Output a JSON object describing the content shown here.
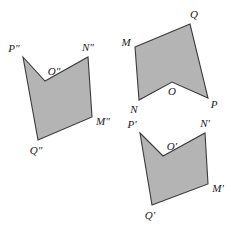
{
  "figure": {
    "background_color": "#ffffff",
    "fill_color": "#b4b4b4",
    "stroke_color": "#3b3b3b",
    "stroke_width": 1.1,
    "label_color": "#1a1a1a",
    "label_font_size": 11
  },
  "shapes": [
    {
      "id": "shape-double-prime",
      "name": "polygon-MNOPQ-double-prime",
      "notation": "double-prime",
      "points": "23,57 45,81 88,57 92,117 38,140",
      "vertices": [
        {
          "key": "P",
          "label": "P\"",
          "x": 23,
          "y": 57,
          "lx": 14,
          "ly": 49,
          "anchor": "middle"
        },
        {
          "key": "O",
          "label": "O\"",
          "x": 45,
          "y": 81,
          "lx": 54,
          "ly": 72,
          "anchor": "middle"
        },
        {
          "key": "N",
          "label": "N\"",
          "x": 88,
          "y": 57,
          "lx": 88,
          "ly": 48,
          "anchor": "middle"
        },
        {
          "key": "M",
          "label": "M\"",
          "x": 92,
          "y": 117,
          "lx": 103,
          "ly": 122,
          "anchor": "middle"
        },
        {
          "key": "Q",
          "label": "Q\"",
          "x": 38,
          "y": 140,
          "lx": 36,
          "ly": 151,
          "anchor": "middle"
        }
      ]
    },
    {
      "id": "shape-plain",
      "name": "polygon-MNOPQ",
      "notation": "plain",
      "points": "135,47 190,24 208,98 172,82 139,100",
      "vertices": [
        {
          "key": "M",
          "label": "M",
          "x": 135,
          "y": 47,
          "lx": 126,
          "ly": 43,
          "anchor": "middle"
        },
        {
          "key": "Q",
          "label": "Q",
          "x": 190,
          "y": 24,
          "lx": 194,
          "ly": 15,
          "anchor": "middle"
        },
        {
          "key": "P",
          "label": "P",
          "x": 208,
          "y": 98,
          "lx": 214,
          "ly": 105,
          "anchor": "middle"
        },
        {
          "key": "O",
          "label": "O",
          "x": 172,
          "y": 82,
          "lx": 172,
          "ly": 92,
          "anchor": "middle"
        },
        {
          "key": "N",
          "label": "N",
          "x": 139,
          "y": 100,
          "lx": 134,
          "ly": 110,
          "anchor": "middle"
        }
      ]
    },
    {
      "id": "shape-prime",
      "name": "polygon-MNOPQ-prime",
      "notation": "prime",
      "points": "140,133 163,156 205,133 208,184 152,205"
    }
  ],
  "shapes_extra": {
    "prime_vertices": [
      {
        "key": "P",
        "label": "P'",
        "x": 140,
        "y": 133,
        "lx": 132,
        "ly": 125,
        "anchor": "middle"
      },
      {
        "key": "O",
        "label": "O'",
        "x": 163,
        "y": 156,
        "lx": 172,
        "ly": 147,
        "anchor": "middle"
      },
      {
        "key": "N",
        "label": "N'",
        "x": 205,
        "y": 133,
        "lx": 205,
        "ly": 124,
        "anchor": "middle"
      },
      {
        "key": "M",
        "label": "M'",
        "x": 208,
        "y": 184,
        "lx": 218,
        "ly": 189,
        "anchor": "middle"
      },
      {
        "key": "Q",
        "label": "Q'",
        "x": 152,
        "y": 205,
        "lx": 150,
        "ly": 216,
        "anchor": "middle"
      }
    ]
  }
}
